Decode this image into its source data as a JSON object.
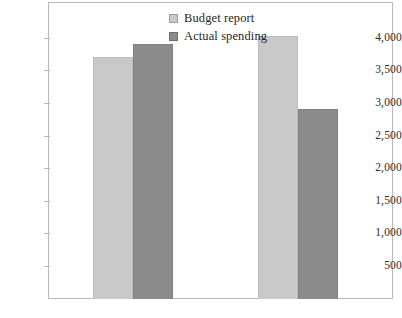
{
  "chart_data": {
    "type": "bar",
    "title": "",
    "subtitle": "",
    "xlabel": "",
    "ylabel": "",
    "categories": [
      "",
      ""
    ],
    "series": [
      {
        "name": "Budget report",
        "values": [
          3730,
          4050
        ],
        "color": "#c9c9c9"
      },
      {
        "name": "Actual spending",
        "values": [
          3930,
          2930
        ],
        "color": "#8b8b8b"
      }
    ],
    "ylim": [
      0,
      4300
    ],
    "yticks": [
      500,
      1000,
      1500,
      2000,
      2500,
      3000,
      3500,
      4000
    ],
    "ytick_labels": [
      "500",
      "1,000",
      "1,500",
      "2,000",
      "2,500",
      "3,000",
      "3,500",
      "4,000"
    ],
    "grid": false,
    "legend_position": "top-center",
    "frame": true,
    "annotations": []
  },
  "legend": {
    "entries": [
      {
        "label": "Budget report",
        "swatch_name": "legend-swatch-budget"
      },
      {
        "label": "Actual spending",
        "swatch_name": "legend-swatch-actual"
      }
    ]
  },
  "axis": {
    "y_labels": [
      "4,000",
      "3,500",
      "3,000",
      "2,500",
      "2,000",
      "1,500",
      "1,000",
      "500"
    ],
    "x_labels": [
      "",
      ""
    ]
  },
  "colors": {
    "budget": "#c9c9c9",
    "actual": "#8b8b8b",
    "frame": "#b9b9b9",
    "text": "#1f1f1f",
    "background": "#ffffff"
  }
}
